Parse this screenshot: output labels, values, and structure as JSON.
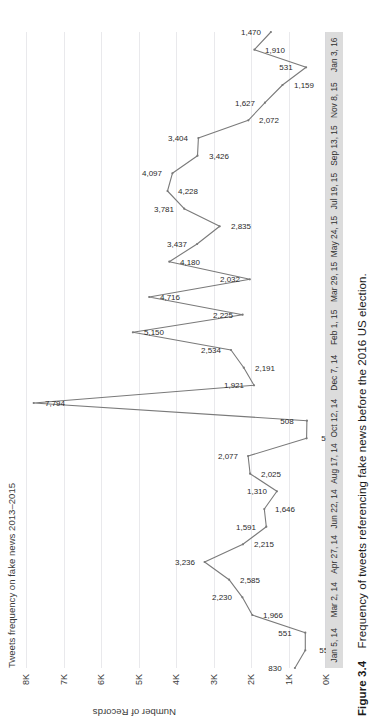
{
  "figure": {
    "number": "Figure 3.4",
    "caption": "Frequency of tweets referencing fake news before the 2016 US election."
  },
  "chart_data": {
    "type": "line",
    "title": "Tweets frequency on fake news 2013–2015",
    "xlabel": "",
    "ylabel": "Number of Records",
    "ylim": [
      0,
      8000
    ],
    "grid": true,
    "legend": false,
    "line_color": "#7a7a7a",
    "y_ticks": [
      "0K",
      "1K",
      "2K",
      "3K",
      "4K",
      "5K",
      "6K",
      "7K",
      "8K"
    ],
    "y_tick_values": [
      0,
      1000,
      2000,
      3000,
      4000,
      5000,
      6000,
      7000,
      8000
    ],
    "x_tick_labels": [
      "Jan 5, 14",
      "Mar 2, 14",
      "Apr 27, 14",
      "Jun 22, 14",
      "Aug 17, 14",
      "Oct 12, 14",
      "Dec 7, 14",
      "Feb 1, 15",
      "Mar 29, 15",
      "May 24, 15",
      "Jul 19, 15",
      "Sep 13, 15",
      "Nov 8, 15",
      "Jan 3, 16"
    ],
    "points": [
      {
        "label": "830",
        "value": 830
      },
      {
        "label": "551",
        "value": 551
      },
      {
        "label": "551",
        "value": 551
      },
      {
        "label": "1,966",
        "value": 1966
      },
      {
        "label": "2,230",
        "value": 2230
      },
      {
        "label": "2,585",
        "value": 2585
      },
      {
        "label": "3,236",
        "value": 3236
      },
      {
        "label": "2,215",
        "value": 2215
      },
      {
        "label": "1,591",
        "value": 1591
      },
      {
        "label": "1,646",
        "value": 1646
      },
      {
        "label": "1,310",
        "value": 1310
      },
      {
        "label": "2,025",
        "value": 2025
      },
      {
        "label": "2,077",
        "value": 2077
      },
      {
        "label": "517",
        "value": 517
      },
      {
        "label": "508",
        "value": 508
      },
      {
        "label": "7,794",
        "value": 7794
      },
      {
        "label": "1,921",
        "value": 1921
      },
      {
        "label": "2,191",
        "value": 2191
      },
      {
        "label": "2,534",
        "value": 2534
      },
      {
        "label": "5,150",
        "value": 5150
      },
      {
        "label": "2,225",
        "value": 2225
      },
      {
        "label": "4,716",
        "value": 4716
      },
      {
        "label": "2,032",
        "value": 2032
      },
      {
        "label": "4,180",
        "value": 4180
      },
      {
        "label": "3,437",
        "value": 3437
      },
      {
        "label": "2,835",
        "value": 2835
      },
      {
        "label": "3,781",
        "value": 3781
      },
      {
        "label": "4,228",
        "value": 4228
      },
      {
        "label": "4,097",
        "value": 4097
      },
      {
        "label": "3,426",
        "value": 3426
      },
      {
        "label": "3,404",
        "value": 3404
      },
      {
        "label": "2,072",
        "value": 2072
      },
      {
        "label": "1,627",
        "value": 1627
      },
      {
        "label": "1,159",
        "value": 1159
      },
      {
        "label": "531",
        "value": 531
      },
      {
        "label": "1,910",
        "value": 1910
      },
      {
        "label": "1,470",
        "value": 1470
      }
    ]
  }
}
